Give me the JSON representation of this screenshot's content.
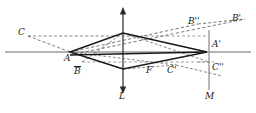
{
  "figure": {
    "type": "geometry-diagram",
    "colors": {
      "solid_stroke": "#1a1a1a",
      "dashed_stroke": "#555555",
      "axis_gray": "#9a9a9a",
      "background": "#ffffff"
    },
    "axes": [
      {
        "name": "horizontal-axis",
        "label": "",
        "y": 52
      },
      {
        "name": "vertical-axis-L",
        "label": "L",
        "x": 123
      },
      {
        "name": "vertical-line-M",
        "label": "M",
        "x": 209
      }
    ],
    "labels": [
      {
        "id": "C",
        "text": "C",
        "bar": false,
        "x": 18,
        "y": 28
      },
      {
        "id": "A",
        "text": "A",
        "bar": false,
        "x": 64,
        "y": 54
      },
      {
        "id": "Bbar",
        "text": "B",
        "bar": true,
        "x": 74,
        "y": 66
      },
      {
        "id": "F",
        "text": "F",
        "bar": false,
        "x": 146,
        "y": 66
      },
      {
        "id": "Cprime",
        "text": "C'",
        "bar": false,
        "x": 167,
        "y": 66
      },
      {
        "id": "Bdprime",
        "text": "B''",
        "bar": false,
        "x": 188,
        "y": 17
      },
      {
        "id": "Bprime",
        "text": "B'",
        "bar": false,
        "x": 232,
        "y": 14
      },
      {
        "id": "Aprime",
        "text": "A'",
        "bar": false,
        "x": 212,
        "y": 40
      },
      {
        "id": "Cdprime",
        "text": "C''",
        "bar": false,
        "x": 212,
        "y": 63
      },
      {
        "id": "L",
        "text": "L",
        "bar": false,
        "x": 119,
        "y": 92
      },
      {
        "id": "M",
        "text": "M",
        "bar": false,
        "x": 205,
        "y": 92
      }
    ],
    "points": {
      "A": {
        "x": 70,
        "y": 52
      },
      "Aprime": {
        "x": 207,
        "y": 52
      },
      "top": {
        "x": 123,
        "y": 33
      },
      "bottom": {
        "x": 123,
        "y": 69
      },
      "C": {
        "x": 28,
        "y": 36
      },
      "Cprime": {
        "x": 176,
        "y": 65
      },
      "Cdprime": {
        "x": 209,
        "y": 62
      },
      "Bdprime": {
        "x": 198,
        "y": 24
      },
      "Bprime": {
        "x": 245,
        "y": 19
      },
      "F": {
        "x": 152,
        "y": 62
      },
      "Bbar": {
        "x": 82,
        "y": 62
      }
    }
  }
}
